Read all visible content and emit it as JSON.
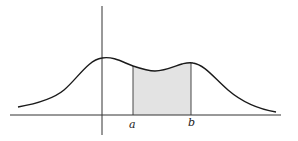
{
  "figure": {
    "title": "",
    "labels": {
      "a": "a",
      "b": "b"
    },
    "colors": {
      "background": "#ffffff",
      "stroke": "#1a1a1a",
      "axis": "#333333",
      "shade": "#e3e3e3"
    }
  }
}
